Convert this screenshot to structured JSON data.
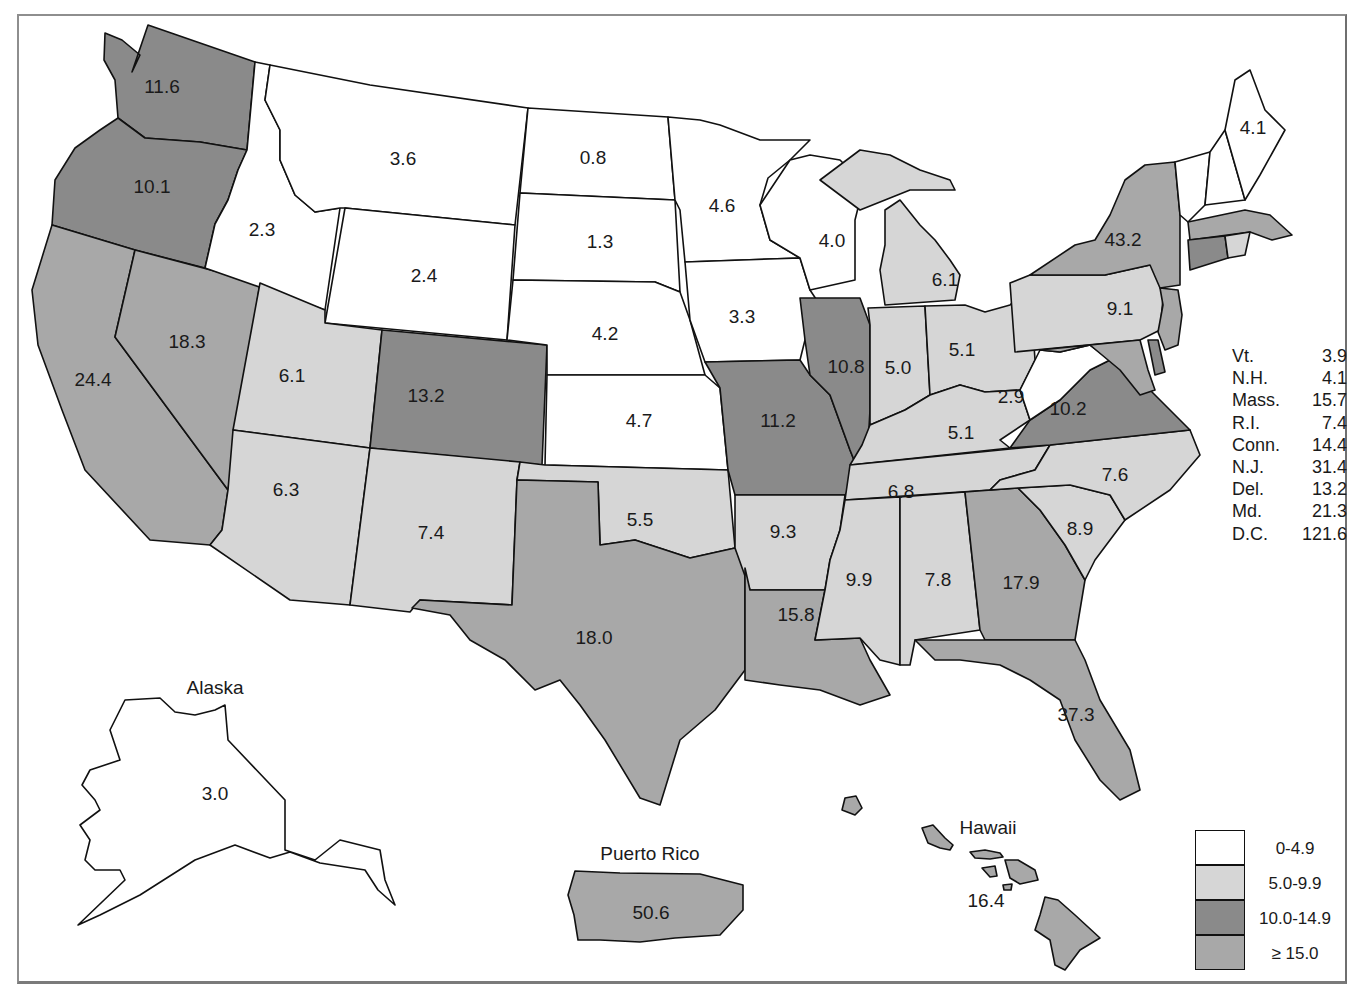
{
  "colors": {
    "bin_0": "#ffffff",
    "bin_1": "#d6d6d6",
    "bin_2": "#8a8a8a",
    "bin_3": "#a8a8a8",
    "stroke": "#111111"
  },
  "legend": {
    "items": [
      {
        "label": "0-4.9",
        "color": "#ffffff"
      },
      {
        "label": "5.0-9.9",
        "color": "#d6d6d6"
      },
      {
        "label": "10.0-14.9",
        "color": "#8a8a8a"
      },
      {
        "label": "≥ 15.0",
        "color": "#a8a8a8"
      }
    ]
  },
  "small_states": [
    {
      "name": "Vt.",
      "value": "3.9"
    },
    {
      "name": "N.H.",
      "value": "4.1"
    },
    {
      "name": "Mass.",
      "value": "15.7"
    },
    {
      "name": "R.I.",
      "value": "7.4"
    },
    {
      "name": "Conn.",
      "value": "14.4"
    },
    {
      "name": "N.J.",
      "value": "31.4"
    },
    {
      "name": "Del.",
      "value": "13.2"
    },
    {
      "name": "Md.",
      "value": "21.3"
    },
    {
      "name": "D.C.",
      "value": "121.6"
    }
  ],
  "insets": {
    "alaska": {
      "label": "Alaska",
      "value": "3.0"
    },
    "hawaii": {
      "label": "Hawaii",
      "value": "16.4"
    },
    "puerto_rico": {
      "label": "Puerto Rico",
      "value": "50.6"
    }
  },
  "states": {
    "WA": "11.6",
    "OR": "10.1",
    "CA": "24.4",
    "NV": "18.3",
    "ID": "2.3",
    "MT": "3.6",
    "WY": "2.4",
    "UT": "6.1",
    "AZ": "6.3",
    "CO": "13.2",
    "NM": "7.4",
    "ND": "0.8",
    "SD": "1.3",
    "NE": "4.2",
    "KS": "4.7",
    "OK": "5.5",
    "TX": "18.0",
    "MN": "4.6",
    "IA": "3.3",
    "MO": "11.2",
    "AR": "9.3",
    "LA": "15.8",
    "WI": "4.0",
    "IL": "10.8",
    "MI": "6.1",
    "IN": "5.0",
    "OH": "5.1",
    "KY": "5.1",
    "TN": "6.8",
    "MS": "9.9",
    "AL": "7.8",
    "GA": "17.9",
    "FL": "37.3",
    "SC": "8.9",
    "NC": "7.6",
    "VA": "10.2",
    "WV": "2.9",
    "PA": "9.1",
    "NY": "43.2",
    "ME": "4.1"
  }
}
